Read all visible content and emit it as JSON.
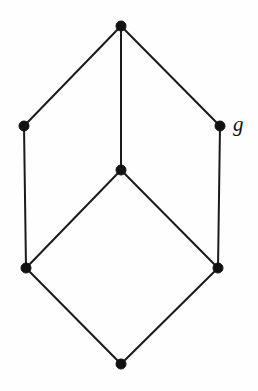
{
  "figure": {
    "kind": "hasse-diagram",
    "title": "",
    "background_color": "#fefefe",
    "edge_color": "#1a1a1a",
    "vertex_color": "#121212",
    "edge_width": 2,
    "vertex_radius": 5,
    "width": 258,
    "height": 391
  },
  "chart_data": {
    "type": "diagram",
    "title": "",
    "xlabel": "",
    "ylabel": "",
    "layout": "hasse-lattice",
    "vertices": [
      {
        "id": "top",
        "name": "top-vertex",
        "x": 121,
        "y": 26,
        "label": "",
        "radius": 5
      },
      {
        "id": "left",
        "name": "left-vertex",
        "x": 24,
        "y": 126,
        "label": "",
        "radius": 5
      },
      {
        "id": "right",
        "name": "right-vertex",
        "x": 220,
        "y": 126,
        "label": "g",
        "radius": 5
      },
      {
        "id": "middle",
        "name": "middle-vertex",
        "x": 121,
        "y": 170,
        "label": "",
        "radius": 5
      },
      {
        "id": "bottom-left",
        "name": "bottom-left-vertex",
        "x": 26,
        "y": 268,
        "label": "",
        "radius": 5
      },
      {
        "id": "bottom-right",
        "name": "bottom-right-vertex",
        "x": 218,
        "y": 268,
        "label": "",
        "radius": 5
      },
      {
        "id": "bottom",
        "name": "bottom-vertex",
        "x": 121,
        "y": 364,
        "label": "",
        "radius": 5
      }
    ],
    "edges": [
      {
        "from": "top",
        "to": "left",
        "name": "edge-top-left"
      },
      {
        "from": "top",
        "to": "middle",
        "name": "edge-top-middle"
      },
      {
        "from": "top",
        "to": "right",
        "name": "edge-top-right"
      },
      {
        "from": "left",
        "to": "bottom-left",
        "name": "edge-left-bottomleft"
      },
      {
        "from": "right",
        "to": "bottom-right",
        "name": "edge-right-bottomright"
      },
      {
        "from": "middle",
        "to": "bottom-left",
        "name": "edge-middle-bottomleft"
      },
      {
        "from": "middle",
        "to": "bottom-right",
        "name": "edge-middle-bottomright"
      },
      {
        "from": "bottom-left",
        "to": "bottom",
        "name": "edge-bottomleft-bottom"
      },
      {
        "from": "bottom-right",
        "to": "bottom",
        "name": "edge-bottomright-bottom"
      }
    ],
    "labels": [
      {
        "text": "g",
        "x": 233,
        "y": 114,
        "style": "italic-serif",
        "font_size": 21,
        "attached_to": "right"
      }
    ]
  }
}
